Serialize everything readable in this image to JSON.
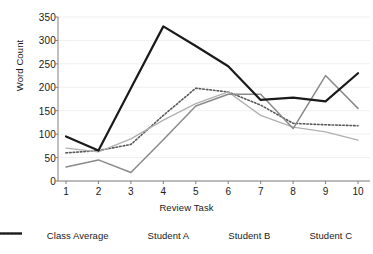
{
  "chart_data": {
    "type": "line",
    "title": "",
    "xlabel": "Review Task",
    "ylabel": "Word Count",
    "x": [
      1,
      2,
      3,
      4,
      5,
      6,
      7,
      8,
      9,
      10
    ],
    "xticklabels": [
      "1",
      "2",
      "3",
      "4",
      "5",
      "6",
      "7",
      "8",
      "9",
      "10"
    ],
    "yticks": [
      0,
      50,
      100,
      150,
      200,
      250,
      300,
      350
    ],
    "yticklabels": [
      "0",
      "50",
      "100",
      "150",
      "200",
      "250",
      "300",
      "350"
    ],
    "xlim": [
      1,
      10
    ],
    "ylim": [
      0,
      350
    ],
    "grid": true,
    "grid_axis": "y",
    "legend_position": "bottom",
    "series": [
      {
        "name": "Class Average",
        "style": "dotted",
        "color": "#595959",
        "width": 1.6,
        "values": [
          60,
          65,
          78,
          140,
          198,
          190,
          162,
          123,
          120,
          118
        ]
      },
      {
        "name": "Student A",
        "style": "solid",
        "color": "#b0b0b0",
        "width": 1.3,
        "values": [
          70,
          62,
          90,
          130,
          165,
          190,
          140,
          115,
          105,
          87
        ]
      },
      {
        "name": "Student B",
        "style": "solid",
        "color": "#8a8a8a",
        "width": 1.5,
        "values": [
          30,
          45,
          18,
          88,
          160,
          185,
          185,
          112,
          225,
          155
        ]
      },
      {
        "name": "Student C",
        "style": "solid",
        "color": "#1a1a1a",
        "width": 2.2,
        "values": [
          95,
          65,
          198,
          330,
          288,
          245,
          173,
          178,
          170,
          230
        ]
      }
    ]
  },
  "axes": {
    "y_title": "Word Count",
    "x_title": "Review Task"
  },
  "legend": {
    "items": [
      {
        "label": "Class Average"
      },
      {
        "label": "Student A"
      },
      {
        "label": "Student B"
      },
      {
        "label": "Student C"
      }
    ]
  },
  "colors": {
    "axis": "#808080",
    "grid": "#efefef",
    "text": "#1a1a1a",
    "background": "#ffffff"
  }
}
